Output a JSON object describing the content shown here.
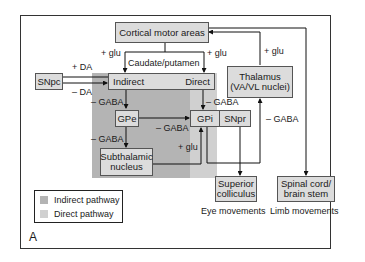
{
  "diagram": {
    "panel_label": "A",
    "nodes": {
      "cortex": "Cortical motor areas",
      "striatum": "Caudate/putamen",
      "indirect": "Indirect",
      "direct": "Direct",
      "snpc": "SNpc",
      "thalamus_line1": "Thalamus",
      "thalamus_line2": "(VA/VL nuclei)",
      "gpe": "GPe",
      "gpi": "GPi",
      "snpr": "SNpr",
      "stn_line1": "Subthalamic",
      "stn_line2": "nucleus",
      "sc_line1": "Superior",
      "sc_line2": "colliculus",
      "spinal_line1": "Spinal cord/",
      "spinal_line2": "brain stem"
    },
    "edge_labels": {
      "cortex_to_indirect": "+ glu",
      "cortex_to_direct": "+ glu",
      "thalamus_to_cortex": "+ glu",
      "snpc_to_direct": "+ DA",
      "snpc_to_indirect": "– DA",
      "indirect_to_gpe": "– GABA",
      "direct_to_gpi": "– GABA",
      "gpe_to_gpi": "– GABA",
      "gpe_to_stn": "– GABA",
      "stn_to_gpi": "+ glu",
      "gpi_to_thalamus": "– GABA"
    },
    "outputs": {
      "eye": "Eye movements",
      "limb": "Limb movements"
    },
    "legend": [
      {
        "label": "Indirect pathway",
        "color": "#b4b4b4"
      },
      {
        "label": "Direct pathway",
        "color": "#d0d0d0"
      }
    ]
  }
}
